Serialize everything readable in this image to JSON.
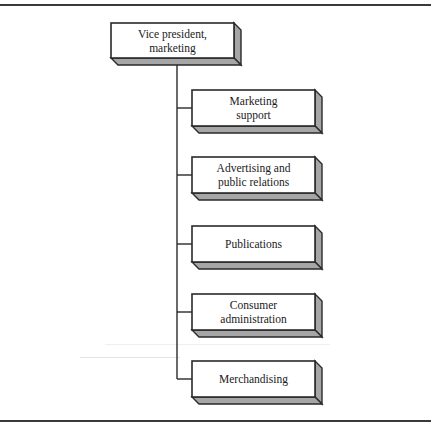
{
  "diagram": {
    "type": "org-chart",
    "root": {
      "id": "vp-marketing",
      "label": "Vice president,\nmarketing"
    },
    "children": [
      {
        "id": "marketing-support",
        "label": "Marketing\nsupport"
      },
      {
        "id": "advertising-public-relations",
        "label": "Advertising and\npublic relations"
      },
      {
        "id": "publications",
        "label": "Publications"
      },
      {
        "id": "consumer-administration",
        "label": "Consumer\nadministration"
      },
      {
        "id": "merchandising",
        "label": "Merchandising"
      }
    ],
    "colors": {
      "line": "#2a2a2a",
      "box_face": "#ffffff",
      "box_shadow": "#a6a6a6",
      "rule": "#3a3a3a"
    }
  }
}
